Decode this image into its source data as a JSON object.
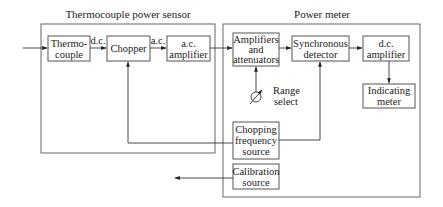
{
  "groups": {
    "sensor": {
      "title": "Thermocouple power sensor"
    },
    "meter": {
      "title": "Power meter"
    }
  },
  "blocks": {
    "thermocouple": [
      "Thermo-",
      "couple"
    ],
    "chopper": [
      "Chopper"
    ],
    "ac_amplifier": [
      "a.c.",
      "amplifier"
    ],
    "amplifiers_attenuators": [
      "Amplifiers",
      "and",
      "attenuators"
    ],
    "synchronous_detector": [
      "Synchronous",
      "detector"
    ],
    "dc_amplifier": [
      "d.c.",
      "amplifier"
    ],
    "indicating_meter": [
      "Indicating",
      "meter"
    ],
    "chopping_source": [
      "Chopping",
      "frequency",
      "source"
    ],
    "calibration_source": [
      "Calibration",
      "source"
    ]
  },
  "signals": {
    "dc": "d.c.",
    "ac": "a.c."
  },
  "range_select": [
    "Range",
    "select"
  ]
}
